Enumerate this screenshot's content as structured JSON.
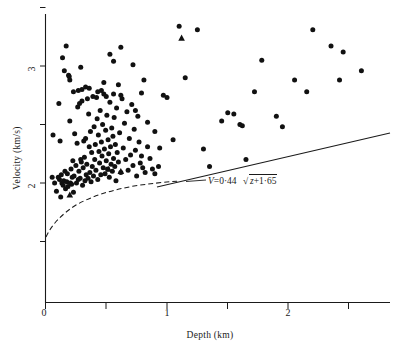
{
  "chart_data": {
    "type": "scatter",
    "title": "",
    "xlabel": "Depth (km)",
    "ylabel": "Velocity (km/s)",
    "xlim": [
      0,
      2.95
    ],
    "ylim": [
      1.4,
      3.45
    ],
    "grid": false,
    "legend_position": "none",
    "xticks": [
      0,
      0.5,
      1,
      1.5,
      2,
      2.5
    ],
    "xtick_labels": [
      "0",
      "",
      "1",
      "",
      "2",
      ""
    ],
    "yticks": [
      1.5,
      2,
      2.5,
      3,
      3.5
    ],
    "ytick_labels": [
      "",
      "2",
      "",
      "3",
      ""
    ],
    "annotation": {
      "text": "V = 0.44 √(z + 1.65)",
      "lhs": "V",
      "equals": "=",
      "coefficient": "0·44",
      "radicand": "z+1·65",
      "x": 1.05,
      "y": 2.06
    },
    "series": [
      {
        "name": "observations",
        "marker": "circle",
        "color": "#111111",
        "points": [
          [
            0.055,
            2.05
          ],
          [
            0.062,
            2.41
          ],
          [
            0.075,
            2.0
          ],
          [
            0.09,
            1.93
          ],
          [
            0.105,
            2.05
          ],
          [
            0.11,
            2.68
          ],
          [
            0.115,
            2.03
          ],
          [
            0.12,
            2.36
          ],
          [
            0.125,
            1.88
          ],
          [
            0.13,
            2.07
          ],
          [
            0.135,
            2.0
          ],
          [
            0.14,
            3.07
          ],
          [
            0.145,
            1.98
          ],
          [
            0.15,
            2.02
          ],
          [
            0.155,
            2.96
          ],
          [
            0.16,
            2.1
          ],
          [
            0.165,
            1.95
          ],
          [
            0.17,
            3.17
          ],
          [
            0.175,
            2.01
          ],
          [
            0.18,
            2.08
          ],
          [
            0.185,
            1.97
          ],
          [
            0.19,
            2.92
          ],
          [
            0.195,
            2.91
          ],
          [
            0.2,
            2.53
          ],
          [
            0.205,
            2.0
          ],
          [
            0.21,
            2.12
          ],
          [
            0.215,
            1.99
          ],
          [
            0.22,
            2.05
          ],
          [
            0.225,
            2.19
          ],
          [
            0.23,
            1.92
          ],
          [
            0.235,
            2.06
          ],
          [
            0.24,
            2.42
          ],
          [
            0.25,
            2.15
          ],
          [
            0.255,
            2.0
          ],
          [
            0.26,
            2.34
          ],
          [
            0.265,
            2.65
          ],
          [
            0.27,
            2.03
          ],
          [
            0.275,
            2.1
          ],
          [
            0.28,
            2.68
          ],
          [
            0.285,
            2.04
          ],
          [
            0.29,
            2.2
          ],
          [
            0.295,
            2.18
          ],
          [
            0.3,
            2.7
          ],
          [
            0.305,
            1.98
          ],
          [
            0.31,
            2.13
          ],
          [
            0.315,
            2.36
          ],
          [
            0.32,
            2.22
          ],
          [
            0.325,
            2.02
          ],
          [
            0.33,
            2.38
          ],
          [
            0.335,
            2.07
          ],
          [
            0.34,
            2.16
          ],
          [
            0.345,
            2.72
          ],
          [
            0.35,
            2.04
          ],
          [
            0.355,
            2.59
          ],
          [
            0.36,
            2.31
          ],
          [
            0.365,
            2.09
          ],
          [
            0.37,
            2.44
          ],
          [
            0.375,
            2.01
          ],
          [
            0.38,
            2.26
          ],
          [
            0.385,
            2.14
          ],
          [
            0.39,
            2.74
          ],
          [
            0.395,
            2.06
          ],
          [
            0.4,
            2.48
          ],
          [
            0.405,
            2.2
          ],
          [
            0.41,
            2.33
          ],
          [
            0.415,
            2.11
          ],
          [
            0.42,
            2.73
          ],
          [
            0.425,
            2.55
          ],
          [
            0.43,
            2.03
          ],
          [
            0.435,
            2.41
          ],
          [
            0.44,
            2.27
          ],
          [
            0.445,
            2.17
          ],
          [
            0.45,
            2.62
          ],
          [
            0.455,
            2.07
          ],
          [
            0.46,
            2.35
          ],
          [
            0.465,
            2.23
          ],
          [
            0.47,
            2.5
          ],
          [
            0.475,
            2.13
          ],
          [
            0.48,
            2.86
          ],
          [
            0.485,
            2.29
          ],
          [
            0.49,
            2.08
          ],
          [
            0.495,
            2.45
          ],
          [
            0.5,
            2.19
          ],
          [
            0.505,
            2.58
          ],
          [
            0.51,
            2.12
          ],
          [
            0.515,
            2.37
          ],
          [
            0.52,
            2.25
          ],
          [
            0.525,
            2.05
          ],
          [
            0.53,
            2.69
          ],
          [
            0.535,
            2.31
          ],
          [
            0.54,
            2.16
          ],
          [
            0.545,
            2.47
          ],
          [
            0.55,
            2.1
          ],
          [
            0.555,
            2.4
          ],
          [
            0.56,
            2.21
          ],
          [
            0.565,
            2.56
          ],
          [
            0.57,
            2.14
          ],
          [
            0.575,
            2.33
          ],
          [
            0.58,
            2.02
          ],
          [
            0.585,
            2.64
          ],
          [
            0.59,
            2.26
          ],
          [
            0.6,
            2.18
          ],
          [
            0.61,
            2.43
          ],
          [
            0.62,
            2.09
          ],
          [
            0.63,
            2.72
          ],
          [
            0.64,
            2.3
          ],
          [
            0.65,
            2.51
          ],
          [
            0.66,
            2.2
          ],
          [
            0.67,
            2.61
          ],
          [
            0.68,
            2.11
          ],
          [
            0.69,
            2.38
          ],
          [
            0.7,
            2.24
          ],
          [
            0.71,
            2.67
          ],
          [
            0.72,
            2.15
          ],
          [
            0.73,
            2.46
          ],
          [
            0.74,
            2.28
          ],
          [
            0.75,
            2.06
          ],
          [
            0.76,
            2.57
          ],
          [
            0.77,
            2.35
          ],
          [
            0.78,
            2.17
          ],
          [
            0.79,
            2.23
          ],
          [
            0.8,
            2.13
          ],
          [
            0.82,
            2.09
          ],
          [
            0.84,
            2.31
          ],
          [
            0.86,
            2.21
          ],
          [
            0.88,
            2.12
          ],
          [
            0.9,
            2.08
          ],
          [
            0.93,
            2.14
          ],
          [
            0.2,
            2.88
          ],
          [
            0.23,
            2.78
          ],
          [
            0.27,
            2.79
          ],
          [
            0.3,
            2.8
          ],
          [
            0.33,
            2.82
          ],
          [
            0.36,
            2.81
          ],
          [
            0.43,
            2.78
          ],
          [
            0.46,
            2.79
          ],
          [
            0.48,
            2.76
          ],
          [
            0.5,
            2.74
          ],
          [
            0.53,
            3.1
          ],
          [
            0.56,
            2.76
          ],
          [
            0.6,
            2.84
          ],
          [
            0.62,
            2.75
          ],
          [
            0.29,
            2.99
          ],
          [
            0.56,
            3.04
          ],
          [
            0.62,
            3.16
          ],
          [
            0.72,
            3.01
          ],
          [
            0.74,
            2.62
          ],
          [
            0.79,
            2.77
          ],
          [
            0.81,
            2.88
          ],
          [
            0.84,
            2.52
          ],
          [
            0.9,
            2.44
          ],
          [
            0.94,
            2.3
          ],
          [
            0.97,
            2.75
          ],
          [
            1.0,
            2.73
          ],
          [
            1.05,
            2.37
          ],
          [
            1.1,
            3.34
          ],
          [
            1.15,
            2.9
          ],
          [
            1.25,
            3.31
          ],
          [
            1.3,
            2.29
          ],
          [
            1.35,
            2.14
          ],
          [
            1.45,
            2.53
          ],
          [
            1.5,
            2.6
          ],
          [
            1.55,
            2.59
          ],
          [
            1.6,
            2.5
          ],
          [
            1.62,
            2.49
          ],
          [
            1.65,
            2.2
          ],
          [
            1.72,
            2.78
          ],
          [
            1.78,
            3.05
          ],
          [
            1.9,
            2.57
          ],
          [
            1.95,
            2.48
          ],
          [
            2.05,
            2.88
          ],
          [
            2.15,
            2.78
          ],
          [
            2.2,
            3.31
          ],
          [
            2.35,
            3.17
          ],
          [
            2.42,
            2.88
          ],
          [
            2.45,
            3.12
          ],
          [
            2.6,
            2.96
          ]
        ]
      },
      {
        "name": "special-observations",
        "marker": "triangle",
        "color": "#111111",
        "points": [
          [
            1.12,
            3.24
          ],
          [
            0.62,
            2.1
          ],
          [
            0.52,
            2.12
          ],
          [
            0.2,
            1.9
          ]
        ]
      }
    ],
    "fit_line": {
      "name": "v = 0.44 sqrt(z + 1.65)",
      "equation_coefficient": 0.44,
      "equation_offset": 1.65,
      "style": "solid",
      "color": "#1a1a1a"
    },
    "envelope_curve": {
      "name": "lower-envelope",
      "style": "dashed",
      "color": "#1a1a1a"
    }
  },
  "labels": {
    "x_axis_title": "Depth (km)",
    "y_axis_title": "Velocity (km/s)",
    "x_tick_0": "0",
    "x_tick_1": "1",
    "x_tick_2": "2",
    "y_tick_2": "2",
    "y_tick_3": "3"
  },
  "equation": {
    "v_symbol": "V",
    "equals": "=",
    "coefficient": "0·44",
    "radical": "√",
    "radicand": "z+1·65"
  }
}
